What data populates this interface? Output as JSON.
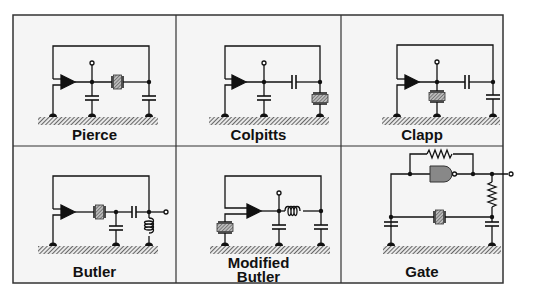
{
  "figure": {
    "layout": {
      "rows": 2,
      "columns": 3
    },
    "colors": {
      "background": "#ffffff",
      "cell_background": "#f4f4f4",
      "border": "#333333",
      "wire": "#111111",
      "ground_hatch": "#555555",
      "crystal_fill": "#888888",
      "gate_fill": "#888888"
    }
  },
  "cells": [
    {
      "label": "Pierce",
      "components": [
        "amplifier",
        "crystal-series",
        "capacitor-shunt",
        "capacitor-shunt",
        "output-terminal",
        "ground"
      ]
    },
    {
      "label": "Colpitts",
      "components": [
        "amplifier",
        "capacitor-series",
        "capacitor-shunt",
        "crystal-shunt",
        "output-terminal",
        "ground"
      ]
    },
    {
      "label": "Clapp",
      "components": [
        "amplifier",
        "crystal-shunt",
        "capacitor-series",
        "capacitor-shunt",
        "output-terminal",
        "ground"
      ]
    },
    {
      "label": "Butler",
      "components": [
        "amplifier",
        "crystal-series",
        "capacitor-shunt",
        "capacitor-series",
        "inductor-shunt",
        "output-terminal",
        "ground"
      ]
    },
    {
      "label_line1": "Modified",
      "label_line2": "Butler",
      "components": [
        "amplifier",
        "crystal-shunt",
        "capacitor-shunt",
        "inductor-series",
        "capacitor-shunt",
        "output-terminal",
        "ground"
      ]
    },
    {
      "label": "Gate",
      "components": [
        "nand-gate",
        "resistor-feedback",
        "resistor-series",
        "crystal-series",
        "capacitor-shunt",
        "capacitor-shunt",
        "output-terminal",
        "ground"
      ]
    }
  ]
}
